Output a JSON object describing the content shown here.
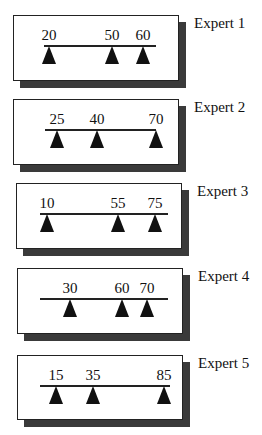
{
  "experts": [
    {
      "label": "Expert 1",
      "box": {
        "left": 13,
        "top": 15,
        "width": 166,
        "height": 66
      },
      "line": {
        "y": 46,
        "x1": 44,
        "x2": 156
      },
      "markers": [
        {
          "value": "20",
          "x": 49
        },
        {
          "value": "50",
          "x": 112
        },
        {
          "value": "60",
          "x": 143
        }
      ]
    },
    {
      "label": "Expert 2",
      "box": {
        "left": 13,
        "top": 99,
        "width": 166,
        "height": 66
      },
      "line": {
        "y": 130,
        "x1": 45,
        "x2": 156
      },
      "markers": [
        {
          "value": "25",
          "x": 57
        },
        {
          "value": "40",
          "x": 97
        },
        {
          "value": "70",
          "x": 156
        }
      ]
    },
    {
      "label": "Expert 3",
      "box": {
        "left": 16,
        "top": 183,
        "width": 166,
        "height": 66
      },
      "line": {
        "y": 214,
        "x1": 40,
        "x2": 168
      },
      "markers": [
        {
          "value": "10",
          "x": 47
        },
        {
          "value": "55",
          "x": 118
        },
        {
          "value": "75",
          "x": 155
        }
      ]
    },
    {
      "label": "Expert 4",
      "box": {
        "left": 17,
        "top": 268,
        "width": 166,
        "height": 66
      },
      "line": {
        "y": 299,
        "x1": 40,
        "x2": 168
      },
      "markers": [
        {
          "value": "30",
          "x": 70
        },
        {
          "value": "60",
          "x": 122
        },
        {
          "value": "70",
          "x": 147
        }
      ]
    },
    {
      "label": "Expert 5",
      "box": {
        "left": 17,
        "top": 355,
        "width": 166,
        "height": 65
      },
      "line": {
        "y": 386,
        "x1": 40,
        "x2": 170
      },
      "markers": [
        {
          "value": "15",
          "x": 56
        },
        {
          "value": "35",
          "x": 93
        },
        {
          "value": "85",
          "x": 164
        }
      ]
    }
  ],
  "colors": {
    "shadow": "#3a3a3a",
    "marker": "#111111",
    "border": "#222222"
  }
}
